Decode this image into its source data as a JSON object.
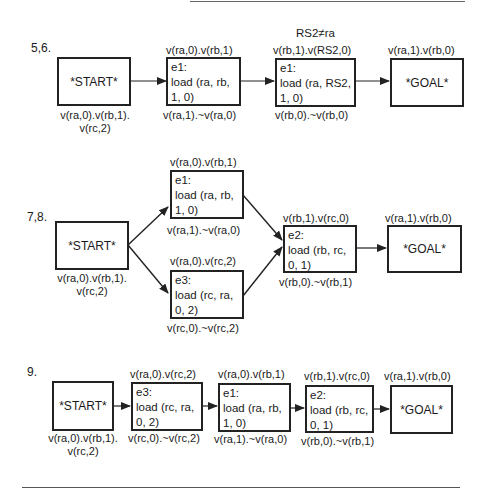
{
  "diagrams": [
    {
      "label": "5,6.",
      "constraint": "RS2≠ra",
      "start": {
        "text": "*START*",
        "post_line1": "v(ra,0).v(rb,1).",
        "post_line2": "v(rc,2)"
      },
      "steps": [
        {
          "pre": "v(ra,0).v(rb,1)",
          "id": "e1:",
          "op_line1": "load (ra, rb,",
          "op_line2": "1, 0)",
          "post": "v(ra,1).~v(ra,0)"
        },
        {
          "pre": "v(rb,1).v(RS2,0)",
          "id": "e1:",
          "op_line1": "load (ra, RS2,",
          "op_line2": "1, 0)",
          "post": "v(rb,0).~v(rb,0)"
        }
      ],
      "goal": {
        "pre": "v(ra,1).v(rb,0)",
        "text": "*GOAL*"
      }
    },
    {
      "label": "7,8.",
      "start": {
        "text": "*START*",
        "post_line1": "v(ra,0).v(rb,1).",
        "post_line2": "v(rc,2)"
      },
      "steps": [
        {
          "pre": "v(ra,0).v(rb,1)",
          "id": "e1:",
          "op_line1": "load (ra, rb,",
          "op_line2": "1, 0)",
          "post": "v(ra,1).~v(ra,0)"
        },
        {
          "pre": "v(ra,0).v(rc,2)",
          "id": "e3:",
          "op_line1": "load (rc, ra,",
          "op_line2": "0, 2)",
          "post": "v(rc,0).~v(rc,2)"
        },
        {
          "pre": "v(rb,1).v(rc,0)",
          "id": "e2:",
          "op_line1": "load (rb, rc,",
          "op_line2": "0, 1)",
          "post": "v(rb,0).~v(rb,1)"
        }
      ],
      "goal": {
        "pre": "v(ra,1).v(rb,0)",
        "text": "*GOAL*"
      }
    },
    {
      "label": "9.",
      "start": {
        "text": "*START*",
        "post_line1": "v(ra,0).v(rb,1).",
        "post_line2": "v(rc,2)"
      },
      "steps": [
        {
          "pre": "v(ra,0).v(rc,2)",
          "id": "e3:",
          "op_line1": "load (rc, ra,",
          "op_line2": "0, 2)",
          "post": "v(rc,0).~v(rc,2)"
        },
        {
          "pre": "v(ra,0).v(rb,1)",
          "id": "e1:",
          "op_line1": "load (ra, rb,",
          "op_line2": "1, 0)",
          "post": "v(ra,1).~v(ra,0)"
        },
        {
          "pre": "v(rb,1).v(rc,0)",
          "id": "e2:",
          "op_line1": "load (rb, rc,",
          "op_line2": "0, 1)",
          "post": "v(rb,0).~v(rb,1)"
        }
      ],
      "goal": {
        "pre": "v(ra,1).v(rb,0)",
        "text": "*GOAL*"
      }
    }
  ]
}
